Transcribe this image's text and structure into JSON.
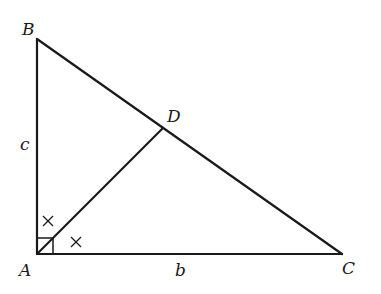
{
  "diagram": {
    "title": "",
    "type": "right-triangle-with-angle-bisector",
    "points": {
      "A": {
        "label": "A",
        "x": 37,
        "y": 254
      },
      "B": {
        "label": "B",
        "x": 37,
        "y": 39
      },
      "C": {
        "label": "C",
        "x": 342,
        "y": 254
      },
      "D": {
        "label": "D",
        "x": 163,
        "y": 128
      }
    },
    "sides": {
      "c": {
        "label": "c",
        "between": [
          "A",
          "B"
        ]
      },
      "b": {
        "label": "b",
        "between": [
          "A",
          "C"
        ]
      }
    },
    "segments": [
      {
        "from": "A",
        "to": "B"
      },
      {
        "from": "A",
        "to": "C"
      },
      {
        "from": "B",
        "to": "C"
      },
      {
        "from": "A",
        "to": "D"
      }
    ],
    "markers": {
      "right_angle_at": "A",
      "equal_angle_marks": [
        "×",
        "×"
      ]
    }
  }
}
